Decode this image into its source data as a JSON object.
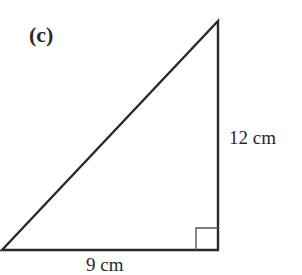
{
  "figure": {
    "part_label": "(c)",
    "shape": "right-angled triangle",
    "sides": {
      "vertical": {
        "label": "12 cm",
        "value": 12,
        "unit": "cm"
      },
      "base": {
        "label": "9 cm",
        "value": 9,
        "unit": "cm"
      }
    },
    "right_angle_marker": true,
    "colors": {
      "stroke": "#2a2a2a",
      "marker": "#555555",
      "background": "#ffffff"
    }
  }
}
